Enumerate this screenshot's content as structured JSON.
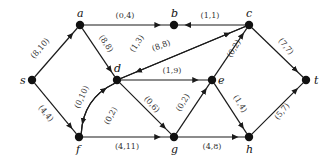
{
  "diagram": {
    "type": "flow-network",
    "nodes": [
      {
        "id": "s",
        "label": "s",
        "x": 32,
        "y": 80,
        "lx": -12,
        "ly": 4
      },
      {
        "id": "a",
        "label": "a",
        "x": 80,
        "y": 25,
        "lx": -3,
        "ly": -8
      },
      {
        "id": "b",
        "label": "b",
        "x": 174,
        "y": 25,
        "lx": -3,
        "ly": -8
      },
      {
        "id": "c",
        "label": "c",
        "x": 249,
        "y": 25,
        "lx": -3,
        "ly": -8
      },
      {
        "id": "d",
        "label": "d",
        "x": 117,
        "y": 80,
        "lx": -3,
        "ly": -8
      },
      {
        "id": "e",
        "label": "e",
        "x": 212,
        "y": 80,
        "lx": 6,
        "ly": 4
      },
      {
        "id": "t",
        "label": "t",
        "x": 306,
        "y": 80,
        "lx": 8,
        "ly": 4
      },
      {
        "id": "f",
        "label": "f",
        "x": 79,
        "y": 137,
        "lx": -3,
        "ly": 16
      },
      {
        "id": "g",
        "label": "g",
        "x": 174,
        "y": 137,
        "lx": -3,
        "ly": 16
      },
      {
        "id": "h",
        "label": "h",
        "x": 249,
        "y": 137,
        "lx": -3,
        "ly": 16
      }
    ],
    "edges": [
      {
        "from": "s",
        "to": "a",
        "label": "(8,10)",
        "lx": 42,
        "ly": 50,
        "rot": -49
      },
      {
        "from": "s",
        "to": "f",
        "label": "(4,4)",
        "lx": 44,
        "ly": 115,
        "rot": 50
      },
      {
        "from": "a",
        "to": "b",
        "label": "(0,4)",
        "lx": 125,
        "ly": 18,
        "rot": 0
      },
      {
        "from": "a",
        "to": "d",
        "label": "(8,8)",
        "lx": 104,
        "ly": 45,
        "rot": 56
      },
      {
        "from": "c",
        "to": "b",
        "label": "(1,1)",
        "lx": 210,
        "ly": 18,
        "rot": 0
      },
      {
        "from": "c",
        "to": "d",
        "label": "(1,3)",
        "lx": 139,
        "ly": 45,
        "rot": -56
      },
      {
        "from": "d",
        "to": "c",
        "label": "(8,8)",
        "lx": 162,
        "ly": 48,
        "rot": -20
      },
      {
        "from": "d",
        "to": "e",
        "label": "(1,9)",
        "lx": 172,
        "ly": 73,
        "rot": 0
      },
      {
        "from": "d",
        "to": "g",
        "label": "(0,6)",
        "lx": 150,
        "ly": 106,
        "rot": 48
      },
      {
        "from": "f",
        "to": "d",
        "label": "(0,10)",
        "lx": 84,
        "ly": 98,
        "rot": -65,
        "curve": "left"
      },
      {
        "from": "d",
        "to": "f",
        "label": "(0,2)",
        "lx": 113,
        "ly": 117,
        "rot": -62,
        "curve": "right"
      },
      {
        "from": "f",
        "to": "g",
        "label": "(4,11)",
        "lx": 127,
        "ly": 149,
        "rot": 0
      },
      {
        "from": "g",
        "to": "e",
        "label": "(0,2)",
        "lx": 185,
        "ly": 104,
        "rot": -58
      },
      {
        "from": "e",
        "to": "c",
        "label": "(0,2)",
        "lx": 236,
        "ly": 50,
        "rot": -58
      },
      {
        "from": "e",
        "to": "h",
        "label": "(1,4)",
        "lx": 238,
        "ly": 105,
        "rot": 58
      },
      {
        "from": "g",
        "to": "h",
        "label": "(4,8)",
        "lx": 212,
        "ly": 149,
        "rot": 0
      },
      {
        "from": "c",
        "to": "t",
        "label": "(7,7)",
        "lx": 284,
        "ly": 48,
        "rot": 50
      },
      {
        "from": "h",
        "to": "t",
        "label": "(5,7)",
        "lx": 284,
        "ly": 113,
        "rot": -50
      }
    ]
  }
}
